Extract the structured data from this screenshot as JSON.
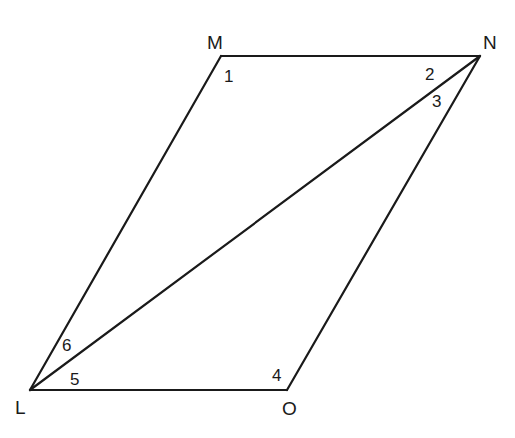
{
  "figure": {
    "type": "parallelogram with diagonal",
    "vertices": {
      "M": {
        "label": "M",
        "x": 221,
        "y": 56
      },
      "N": {
        "label": "N",
        "x": 480,
        "y": 56
      },
      "O": {
        "label": "O",
        "x": 287,
        "y": 390
      },
      "L": {
        "label": "L",
        "x": 30,
        "y": 390
      }
    },
    "segments": [
      "MN",
      "NO",
      "OL",
      "LM",
      "LN"
    ],
    "angle_labels": {
      "a1": "1",
      "a2": "2",
      "a3": "3",
      "a4": "4",
      "a5": "5",
      "a6": "6"
    }
  }
}
